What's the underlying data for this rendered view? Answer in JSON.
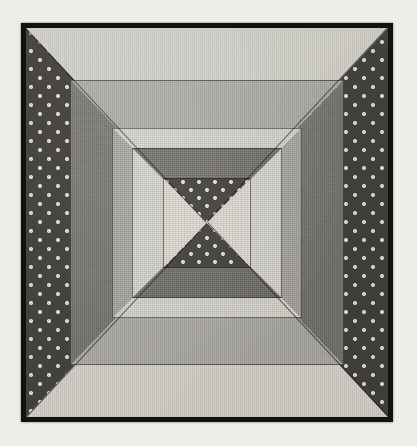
{
  "image": {
    "title": "Pineapple / Log Cabin quilt block photograph",
    "caption": "",
    "medium": "black and white photograph of a pieced fabric quilt block",
    "background_color": "#f2f1ec",
    "frame_color": "#121210"
  },
  "block": {
    "name": "concentric-square-quilt-block",
    "structure": "four nested square rings, each split corner-to-corner into four triangles, around a central hourglass square",
    "ring_count": 4,
    "has_center_hourglass": true
  },
  "palette": {
    "paper": "#f2f1ec",
    "binding_black": "#121210",
    "light_gray": "#d6d4cd",
    "cream": "#dcd9d1",
    "medium_gray": "#b1afa9",
    "medium_gray_alt": "#aaa8a2",
    "dark_gray": "#7d7b76",
    "dark_gray_alt": "#76746f",
    "dotted_print": "#474541",
    "dot_color": "#d9d7d0"
  },
  "rings": [
    {
      "index": 1,
      "name": "outer-ring",
      "top_fabric": "light-gray-solid",
      "bottom_fabric": "light-gray-solid",
      "left_fabric": "dark-polka-dot-print",
      "right_fabric": "dark-polka-dot-print"
    },
    {
      "index": 2,
      "name": "second-ring",
      "top_fabric": "medium-gray-solid",
      "bottom_fabric": "medium-gray-solid",
      "left_fabric": "dark-gray-solid",
      "right_fabric": "dark-gray-solid"
    },
    {
      "index": 3,
      "name": "third-ring",
      "top_fabric": "light-gray-solid",
      "bottom_fabric": "light-gray-solid",
      "left_fabric": "medium-gray-solid",
      "right_fabric": "medium-gray-solid"
    },
    {
      "index": 4,
      "name": "inner-ring",
      "top_fabric": "dark-gray-solid",
      "bottom_fabric": "dark-gray-solid",
      "left_fabric": "light-gray-solid",
      "right_fabric": "light-gray-solid"
    }
  ],
  "center": {
    "name": "center-hourglass",
    "top_fabric": "dark-polka-dot-print",
    "bottom_fabric": "dark-polka-dot-print",
    "left_fabric": "cream-solid",
    "right_fabric": "cream-solid"
  }
}
